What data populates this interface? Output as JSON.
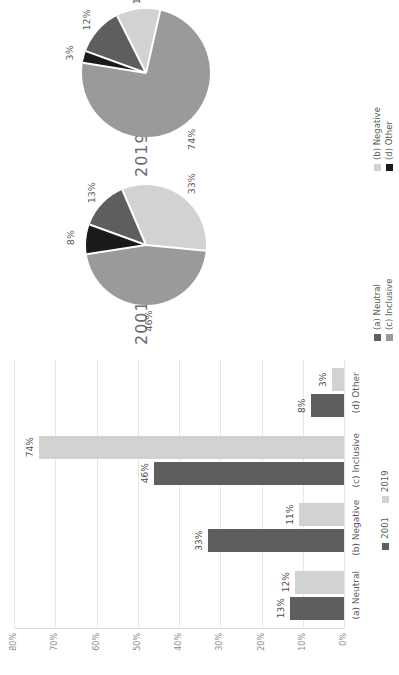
{
  "chart_data": [
    {
      "type": "bar",
      "orientation": "vertical",
      "title": "",
      "xlabel": "",
      "ylabel": "",
      "ylim": [
        0,
        80
      ],
      "ytick_labels": [
        "0%",
        "10%",
        "20%",
        "30%",
        "40%",
        "50%",
        "60%",
        "70%",
        "80%"
      ],
      "ytick_values": [
        0,
        10,
        20,
        30,
        40,
        50,
        60,
        70,
        80
      ],
      "grid": true,
      "legend_position": "bottom",
      "categories": [
        "(a) Neutral",
        "(b) Negative",
        "(c) Inclusive",
        "(d) Other"
      ],
      "series": [
        {
          "name": "2001",
          "color": "#5e5e5e",
          "values": [
            13,
            33,
            46,
            8
          ],
          "data_labels": [
            "13%",
            "33%",
            "46%",
            "8%"
          ]
        },
        {
          "name": "2019",
          "color": "#d2d2d2",
          "values": [
            12,
            11,
            74,
            3
          ],
          "data_labels": [
            "12%",
            "11%",
            "74%",
            "3%"
          ]
        }
      ]
    },
    {
      "type": "pie",
      "title": "2001",
      "labels": [
        "(a) Neutral",
        "(b) Negative",
        "(c) Inclusive",
        "(d) Other"
      ],
      "values": [
        13,
        33,
        46,
        8
      ],
      "data_labels": [
        "13%",
        "33%",
        "46%",
        "8%"
      ],
      "colors": [
        "#5e5e5e",
        "#d2d2d2",
        "#9a9a9a",
        "#1a1a1a"
      ],
      "legend_position": "bottom"
    },
    {
      "type": "pie",
      "title": "2019",
      "labels": [
        "(a) Neutral",
        "(b) Negative",
        "(c) Inclusive",
        "(d) Other"
      ],
      "values": [
        12,
        11,
        74,
        3
      ],
      "data_labels": [
        "12%",
        "11%",
        "74%",
        "3%"
      ],
      "colors": [
        "#5e5e5e",
        "#d2d2d2",
        "#9a9a9a",
        "#1a1a1a"
      ],
      "legend_position": "bottom"
    }
  ],
  "bar_chart": {
    "ytick_labels": [
      "80%",
      "70%",
      "60%",
      "50%",
      "40%",
      "30%",
      "20%",
      "10%",
      "0%"
    ],
    "categories": [
      {
        "label": "(a) Neutral",
        "v2001": "13%",
        "v2019": "12%"
      },
      {
        "label": "(b) Negative",
        "v2001": "33%",
        "v2019": "11%"
      },
      {
        "label": "(c) Inclusive",
        "v2001": "46%",
        "v2019": "74%"
      },
      {
        "label": "(d) Other",
        "v2001": "8%",
        "v2019": "3%"
      }
    ],
    "legend": [
      {
        "label": "2001",
        "color": "#5e5e5e"
      },
      {
        "label": "2019",
        "color": "#d2d2d2"
      }
    ]
  },
  "pie_charts": {
    "first": {
      "title": "2001",
      "slices": [
        {
          "label": "(a) Neutral",
          "value": "13%",
          "color": "#5e5e5e"
        },
        {
          "label": "(b) Negative",
          "value": "33%",
          "color": "#d2d2d2"
        },
        {
          "label": "(c) Inclusive",
          "value": "46%",
          "color": "#9a9a9a"
        },
        {
          "label": "(d) Other",
          "value": "8%",
          "color": "#1a1a1a"
        }
      ]
    },
    "second": {
      "title": "2019",
      "slices": [
        {
          "label": "(a) Neutral",
          "value": "12%",
          "color": "#5e5e5e"
        },
        {
          "label": "(b) Negative",
          "value": "11%",
          "color": "#d2d2d2"
        },
        {
          "label": "(c) Inclusive",
          "value": "74%",
          "color": "#9a9a9a"
        },
        {
          "label": "(d) Other",
          "value": "3%",
          "color": "#1a1a1a"
        }
      ]
    },
    "legend": [
      {
        "label": "(a) Neutral",
        "color": "#5e5e5e"
      },
      {
        "label": "(b) Negative",
        "color": "#d2d2d2"
      },
      {
        "label": "(c) Inclusive",
        "color": "#9a9a9a"
      },
      {
        "label": "(d) Other",
        "color": "#1a1a1a"
      }
    ]
  },
  "colors": {
    "series_2001": "#5e5e5e",
    "series_2019": "#d2d2d2",
    "neutral": "#5e5e5e",
    "negative": "#d2d2d2",
    "inclusive": "#9a9a9a",
    "other": "#1a1a1a",
    "gridline": "#e6e6e6",
    "text": "#5a5a5a"
  }
}
